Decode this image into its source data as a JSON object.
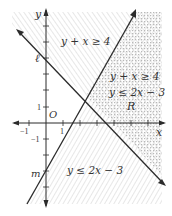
{
  "diagram": {
    "type": "linear-inequality-graph",
    "axes": {
      "x_label": "x",
      "y_label": "y",
      "origin_label": "O",
      "tick_labels": {
        "x_pos": "1",
        "x_neg": "−1",
        "y_pos": "1",
        "y_neg": "−1"
      }
    },
    "lines": [
      {
        "id": "l",
        "label": "ℓ",
        "equation": "y = -x + 4",
        "y_intercept": 4
      },
      {
        "id": "m",
        "label": "m",
        "equation": "y = 2x - 3",
        "y_intercept": -3
      }
    ],
    "region_labels": {
      "top": "y + x ≥ 4",
      "right_1": "y + x ≥ 4",
      "right_2": "y ≤ 2x − 3",
      "right_region": "R",
      "bottom": "y ≤ 2x − 3"
    },
    "colors": {
      "line": "#2b2b2b",
      "hatch": "#c8c8c8",
      "dots": "#bdbdbd",
      "text": "#333333"
    }
  }
}
